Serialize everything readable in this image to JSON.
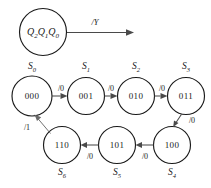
{
  "diagram": {
    "register": {
      "name": "state-register",
      "bits": [
        "Q",
        "2",
        "Q",
        "1",
        "Q",
        "0"
      ],
      "text_q2": "Q",
      "sub_2": "2",
      "text_q1": "Q",
      "sub_1": "1",
      "text_q0": "Q",
      "sub_0": "0",
      "output_label": "/Y"
    },
    "stroke_color": "#1a1a1a",
    "edge_color": "#4a4a4a",
    "background": "#ffffff",
    "states": [
      {
        "id": "S0",
        "code": "000",
        "label_prefix": "S",
        "label_sub": "0",
        "cx": 32,
        "cy": 96,
        "r": 20,
        "label_x": 32,
        "label_y": 67
      },
      {
        "id": "S1",
        "code": "001",
        "label_prefix": "S",
        "label_sub": "1",
        "cx": 86,
        "cy": 96,
        "r": 18.5,
        "label_x": 86,
        "label_y": 67
      },
      {
        "id": "S2",
        "code": "010",
        "label_prefix": "S",
        "label_sub": "2",
        "cx": 136,
        "cy": 96,
        "r": 18.5,
        "label_x": 136,
        "label_y": 67
      },
      {
        "id": "S3",
        "code": "011",
        "label_prefix": "S",
        "label_sub": "3",
        "cx": 186,
        "cy": 96,
        "r": 18.5,
        "label_x": 186,
        "label_y": 67
      },
      {
        "id": "S4",
        "code": "100",
        "label_prefix": "S",
        "label_sub": "4",
        "cx": 172,
        "cy": 145,
        "r": 18.5,
        "label_x": 172,
        "label_y": 173
      },
      {
        "id": "S5",
        "code": "101",
        "label_prefix": "S",
        "label_sub": "5",
        "cx": 117,
        "cy": 145,
        "r": 18.5,
        "label_x": 117,
        "label_y": 173
      },
      {
        "id": "S6",
        "code": "110",
        "label_prefix": "S",
        "label_sub": "6",
        "cx": 62,
        "cy": 145,
        "r": 18.5,
        "label_x": 62,
        "label_y": 173
      }
    ],
    "transitions": [
      {
        "from": "S0",
        "to": "S1",
        "label": "/0",
        "label_x": 61,
        "label_y": 88
      },
      {
        "from": "S1",
        "to": "S2",
        "label": "/0",
        "label_x": 111,
        "label_y": 88
      },
      {
        "from": "S2",
        "to": "S3",
        "label": "/0",
        "label_x": 162,
        "label_y": 88
      },
      {
        "from": "S3",
        "to": "S4",
        "label": "/0",
        "label_x": 190,
        "label_y": 120
      },
      {
        "from": "S4",
        "to": "S5",
        "label": "/0",
        "label_x": 145,
        "label_y": 155
      },
      {
        "from": "S5",
        "to": "S6",
        "label": "/0",
        "label_x": 90,
        "label_y": 155
      },
      {
        "from": "S6",
        "to": "S0",
        "label": "/1",
        "label_x": 29,
        "label_y": 128
      }
    ]
  }
}
